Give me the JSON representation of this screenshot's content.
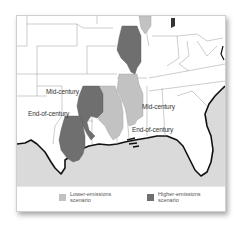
{
  "map": {
    "annotations": {
      "higher_mid": "Mid-century",
      "higher_end": "End-of-century",
      "lower_mid": "Mid-century",
      "lower_end": "End-of-century"
    },
    "colors": {
      "higher_emissions": "#6f6f6f",
      "lower_emissions": "#c2c2c2",
      "ocean": "#dadada",
      "land": "#ffffff",
      "coastline": "#111111"
    }
  },
  "legend": {
    "items": [
      {
        "label_line1": "Lower-emissions",
        "label_line2": "scenario",
        "color": "#c2c2c2"
      },
      {
        "label_line1": "Higher-emissions",
        "label_line2": "scenario",
        "color": "#6f6f6f"
      }
    ]
  }
}
